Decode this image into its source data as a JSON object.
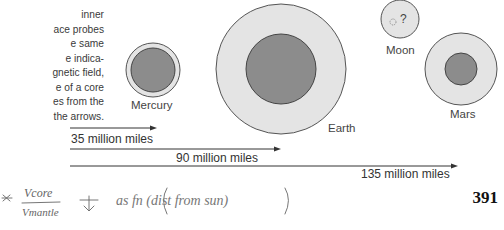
{
  "caption": {
    "lines": [
      "inner",
      "ace probes",
      "e same",
      "e indica-",
      "gnetic field,",
      "e of a core",
      "es from the",
      "the arrows."
    ]
  },
  "planets": [
    {
      "name": "Mercury",
      "outer_color": "#e4e4e4",
      "core_color": "#8c8c8c"
    },
    {
      "name": "Earth",
      "outer_color": "#e4e4e4",
      "core_color": "#8c8c8c"
    },
    {
      "name": "Moon",
      "outer_color": "#e4e4e4",
      "core_label": "?"
    },
    {
      "name": "Mars",
      "outer_color": "#e4e4e4",
      "core_color": "#8c8c8c"
    }
  ],
  "distances": [
    {
      "label": "35 million miles"
    },
    {
      "label": "90 million miles"
    },
    {
      "label": "135 million miles"
    }
  ],
  "page_number": "391",
  "handwritten_note": {
    "text": "* Vcore / Vmantle ↓ as fn(dist from sun)",
    "numerator": "Vcore",
    "denominator": "Vmantle",
    "rest": "as fn (dist from sun)"
  }
}
